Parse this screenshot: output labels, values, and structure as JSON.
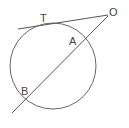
{
  "diagram": {
    "colors": {
      "stroke": "#555555",
      "label": "#444444",
      "background": "#ffffff"
    },
    "circle": {
      "cx": 53,
      "cy": 66,
      "r": 43
    },
    "points": {
      "O": {
        "label": "O",
        "x": 108,
        "y": 15
      },
      "T": {
        "label": "T",
        "x": 44,
        "y": 22
      },
      "A": {
        "label": "A",
        "x": 81,
        "y": 40
      },
      "B": {
        "label": "B",
        "x": 26,
        "y": 100
      }
    },
    "segments": [
      {
        "name": "tangent-OT",
        "from": [
          18,
          29
        ],
        "to": [
          108,
          15
        ]
      },
      {
        "name": "secant-OAB",
        "from": [
          108,
          16
        ],
        "to": [
          12,
          113
        ]
      }
    ],
    "labels": {
      "O": "O",
      "T": "T",
      "A": "A",
      "B": "B"
    }
  }
}
